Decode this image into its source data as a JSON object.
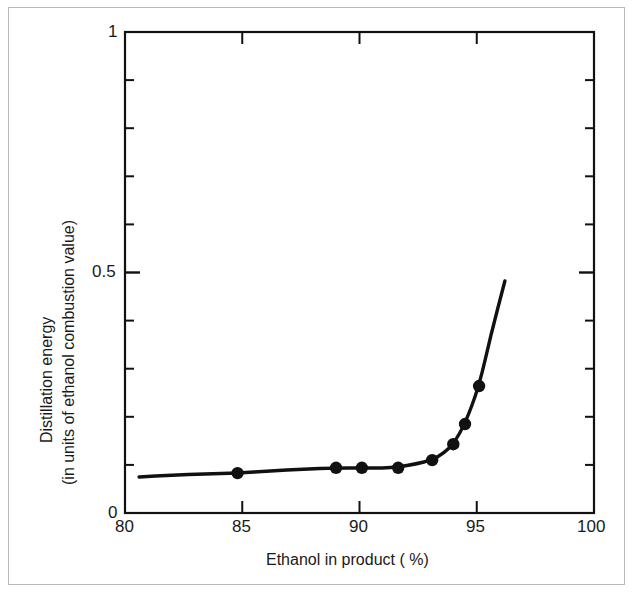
{
  "chart_data": {
    "type": "line",
    "title": "",
    "subtitle": "",
    "xlabel": "Ethanol in product ( %)",
    "ylabel_line1": "Distillation energy",
    "ylabel_line2": "(in units of ethanol combustion value)",
    "xlim": [
      80,
      100
    ],
    "ylim": [
      0,
      1
    ],
    "x_ticks": [
      80,
      85,
      90,
      95,
      100
    ],
    "x_tick_labels": [
      "80",
      "85",
      "90",
      "95",
      "100"
    ],
    "x_minor_tick_step": 5,
    "y_ticks": [
      0,
      0.5,
      1
    ],
    "y_tick_labels": [
      "0",
      "0.5",
      "1"
    ],
    "y_minor_ticks": [
      0.1,
      0.2,
      0.3,
      0.4,
      0.6,
      0.7,
      0.8,
      0.9
    ],
    "grid": false,
    "legend": null,
    "legend_position": "none",
    "marker": "filled-circle",
    "marker_color": "#111111",
    "line_color": "#111111",
    "line_style": "solid",
    "series": [
      {
        "name": "Distillation energy",
        "x": [
          84.8,
          89.0,
          90.1,
          91.65,
          93.1,
          94.0,
          94.5,
          95.1
        ],
        "y": [
          0.083,
          0.094,
          0.094,
          0.094,
          0.11,
          0.143,
          0.185,
          0.264
        ]
      }
    ],
    "curve_path": [
      {
        "x": 80.6,
        "y": 0.0749
      },
      {
        "x": 82.0,
        "y": 0.079
      },
      {
        "x": 83.4,
        "y": 0.0812
      },
      {
        "x": 84.8,
        "y": 0.0832
      },
      {
        "x": 86.2,
        "y": 0.0874
      },
      {
        "x": 87.6,
        "y": 0.0915
      },
      {
        "x": 89.0,
        "y": 0.0936
      },
      {
        "x": 90.1,
        "y": 0.0936
      },
      {
        "x": 91.0,
        "y": 0.0936
      },
      {
        "x": 91.65,
        "y": 0.0957
      },
      {
        "x": 92.4,
        "y": 0.1018
      },
      {
        "x": 93.1,
        "y": 0.1102
      },
      {
        "x": 93.6,
        "y": 0.1248
      },
      {
        "x": 94.0,
        "y": 0.1435
      },
      {
        "x": 94.5,
        "y": 0.185
      },
      {
        "x": 95.1,
        "y": 0.264
      },
      {
        "x": 95.6,
        "y": 0.37
      },
      {
        "x": 96.2,
        "y": 0.4823
      }
    ],
    "annotations": []
  },
  "figure": {
    "background_color": "#ffffff",
    "outer_border_color": "#b9b9b9",
    "axis_color": "#111111"
  }
}
